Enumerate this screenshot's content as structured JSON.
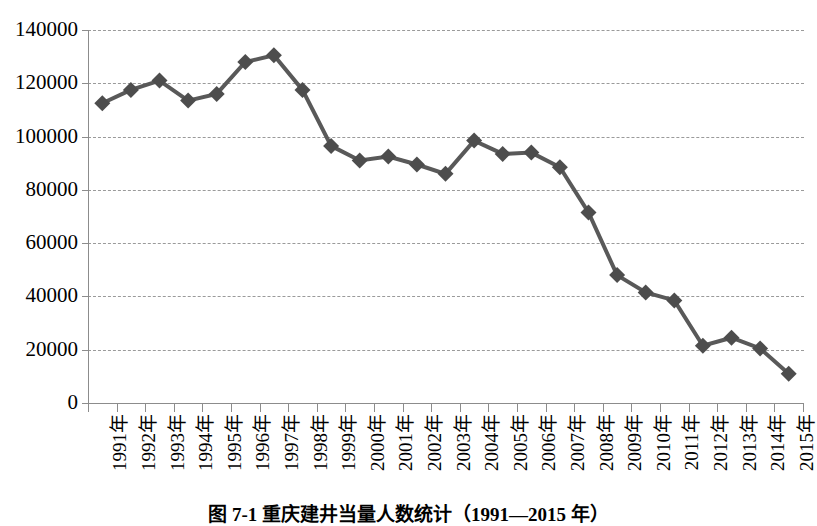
{
  "caption": "图 7-1  重庆建井当量人数统计（1991—2015 年）",
  "chart_data": {
    "type": "line",
    "title": "",
    "subtitle": "",
    "xlabel": "",
    "ylabel": "",
    "categories": [
      "1991年",
      "1992年",
      "1993年",
      "1994年",
      "1995年",
      "1996年",
      "1997年",
      "1998年",
      "1999年",
      "2000年",
      "2001年",
      "2002年",
      "2003年",
      "2004年",
      "2005年",
      "2006年",
      "2007年",
      "2008年",
      "2009年",
      "2010年",
      "2011年",
      "2012年",
      "2013年",
      "2014年",
      "2015年"
    ],
    "values": [
      112500,
      117500,
      121000,
      113500,
      116000,
      128000,
      130500,
      117500,
      96500,
      91000,
      92500,
      89500,
      86000,
      98500,
      93500,
      94000,
      88500,
      71500,
      48000,
      41500,
      38500,
      21500,
      24500,
      20500,
      11000
    ],
    "series": [
      {
        "name": "建井当量人数",
        "values": [
          112500,
          117500,
          121000,
          113500,
          116000,
          128000,
          130500,
          117500,
          96500,
          91000,
          92500,
          89500,
          86000,
          98500,
          93500,
          94000,
          88500,
          71500,
          48000,
          41500,
          38500,
          21500,
          24500,
          20500,
          11000
        ]
      }
    ],
    "ylim": [
      0,
      140000
    ],
    "yticks": [
      0,
      20000,
      40000,
      60000,
      80000,
      100000,
      120000,
      140000
    ],
    "ytick_labels": [
      "0",
      "20000",
      "40000",
      "60000",
      "80000",
      "100000",
      "120000",
      "140000"
    ],
    "grid": "horizontal-dashed",
    "legend": "none",
    "marker": "diamond",
    "line_color": "#595959",
    "marker_color": "#4d4d4d",
    "grid_color": "#9a9a9a",
    "axis_color": "#8c8c8c",
    "background": "#ffffff"
  }
}
